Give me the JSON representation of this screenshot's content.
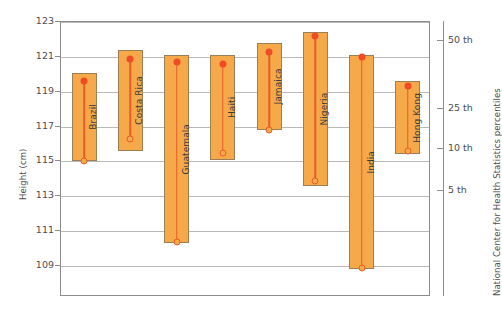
{
  "chart_data": {
    "type": "bar",
    "title": "",
    "subtitle": "",
    "xlabel": "",
    "ylabel": "Height (cm)",
    "ylabel_right": "National Center for Health Statistics percentiles",
    "ylim": [
      108.2,
      123.0
    ],
    "grid": true,
    "legend_position": "none",
    "yticks": [
      123,
      121,
      119,
      117,
      115,
      113,
      111,
      109
    ],
    "ytick_labels": [
      "123",
      "121",
      "119",
      "117",
      "115",
      "113",
      "111",
      "109"
    ],
    "right_axis": {
      "ticks": [
        {
          "label": "50 th",
          "value": 121.9
        },
        {
          "label": "25 th",
          "value": 118.0
        },
        {
          "label": "10 th",
          "value": 115.7
        },
        {
          "label": "5 th",
          "value": 113.3
        }
      ]
    },
    "categories": [
      "Brazil",
      "Costa Rica",
      "Guatemala",
      "Haiti",
      "Jamaica",
      "Nigeria",
      "India",
      "Hong Kong"
    ],
    "series": [
      {
        "name": "Range (bar top / bar bottom)",
        "bar_top": [
          120.1,
          121.4,
          121.1,
          121.1,
          121.8,
          122.4,
          121.1,
          119.6
        ],
        "bar_bottom": [
          115.0,
          115.6,
          110.3,
          115.1,
          116.8,
          113.6,
          108.8,
          115.4
        ]
      },
      {
        "name": "Upper marker (filled)",
        "values": [
          119.6,
          120.9,
          120.7,
          120.6,
          121.3,
          122.2,
          121.0,
          119.3
        ]
      },
      {
        "name": "Lower marker (open)",
        "values": [
          115.0,
          116.3,
          110.4,
          115.5,
          116.8,
          113.9,
          108.9,
          115.6
        ]
      }
    ],
    "colors": {
      "bar_fill": "#f5a949",
      "bar_edge": "#9c7f55",
      "marker_filled": "#ef4b28",
      "marker_open_edge": "#ea5b2b",
      "stem": "#ea5b2b",
      "grid": "#b9b9b9",
      "axis": "#8c8c8c",
      "text": "#4d4d4f"
    }
  }
}
